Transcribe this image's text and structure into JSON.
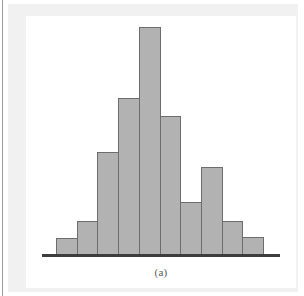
{
  "figure": {
    "caption": "(a)",
    "bar_fill_color": "#b2b2b2",
    "bar_stroke_color": "#6d6d6d",
    "baseline_color": "#3d3d3d",
    "page_background": "#ffffff",
    "margin_background": "#f1f1f1"
  },
  "chart_data": {
    "type": "bar",
    "title": "",
    "subtitle": "",
    "xlabel": "",
    "ylabel": "",
    "categories": [
      "1",
      "2",
      "3",
      "4",
      "5",
      "6",
      "7",
      "8",
      "9",
      "10"
    ],
    "values": [
      16,
      33,
      102,
      156,
      227,
      138,
      52,
      87,
      33,
      17
    ],
    "ylim": [
      0,
      238
    ],
    "xlim": [
      0,
      10
    ],
    "grid": false,
    "legend": null,
    "tick_labels_x": [],
    "tick_labels_y": [],
    "annotations": [
      "(a)"
    ],
    "bar_count": 10
  }
}
